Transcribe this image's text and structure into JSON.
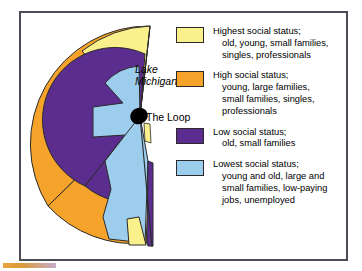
{
  "figure": {
    "title_none": "",
    "map": {
      "labels": [
        {
          "id": "lake",
          "text": "Lake Michigan",
          "style": "italic"
        },
        {
          "id": "loop",
          "text": "The Loop",
          "style": "normal"
        }
      ],
      "center_marker": "the-loop-point"
    },
    "legend": {
      "items": [
        {
          "color": "#FAF08C",
          "head": "Highest social status;",
          "lines": [
            "old, young, small families,",
            "singles, professionals"
          ]
        },
        {
          "color": "#F5A32A",
          "head": "High social status;",
          "lines": [
            "young, large families,",
            "small families, singles,",
            "professionals"
          ]
        },
        {
          "color": "#5B2D8E",
          "head": "Low social status;",
          "lines": [
            "old, small families"
          ]
        },
        {
          "color": "#9DCDEC",
          "head": "Lowest social status;",
          "lines": [
            "young and old, large and",
            "small families, low-paying",
            "jobs, unemployed"
          ]
        }
      ]
    },
    "colors": {
      "highest": "#FAF08C",
      "high": "#F5A32A",
      "low": "#5B2D8E",
      "lowest": "#9DCDEC",
      "loop": "#000000",
      "frame_border": "#4b4d55",
      "outline": "#2a2a2a",
      "background": "#ffffff",
      "accent_bar": "#e8a33d"
    }
  }
}
